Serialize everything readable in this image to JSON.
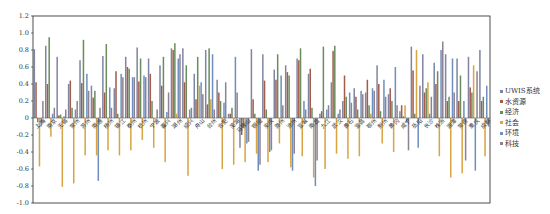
{
  "chart_data": {
    "type": "bar",
    "title": "",
    "xlabel": "",
    "ylabel": "",
    "ylim": [
      -1.0,
      1.2
    ],
    "yticks": [
      1.2,
      1.0,
      0.8,
      0.6,
      0.4,
      0.2,
      0,
      -0.2,
      -0.4,
      -0.6,
      -0.8,
      -1.0
    ],
    "ytick_labels": [
      "1.2",
      "1.0",
      "0.8",
      "0.6",
      "0.4",
      "0.2",
      "0",
      "-0.2",
      "-0.4",
      "-0.6",
      "-0.8",
      "-1.0"
    ],
    "grid": false,
    "legend_position": "right",
    "categories": [
      "上海",
      "南京",
      "无锡",
      "常州",
      "苏州",
      "南通",
      "扬州",
      "镇江",
      "泰州",
      "杭州",
      "宁波",
      "嘉兴",
      "湖州",
      "绍兴",
      "舟山",
      "台州",
      "合肥",
      "芜湖",
      "马鞍山",
      "铜陵",
      "安庆",
      "滁州",
      "池州",
      "宣城",
      "南昌",
      "九江",
      "武汉",
      "黄石",
      "宜昌",
      "鄂州",
      "荆州",
      "黄冈",
      "咸宁",
      "岳阳",
      "长沙",
      "株洲",
      "湘潭",
      "常德",
      "重庆",
      "成都"
    ],
    "series": [
      {
        "name": "UWIS系统",
        "color": "#7f86a3",
        "values": [
          0.81,
          0.85,
          0.72,
          0.4,
          0.68,
          0.38,
          0.73,
          0.35,
          0.72,
          0.83,
          0.7,
          0.62,
          0.82,
          0.82,
          0.52,
          0.8,
          0.45,
          0.05,
          -0.35,
          0.81,
          0.75,
          0.57,
          0.62,
          0.7,
          0.52,
          0.05,
          0.42,
          0.2,
          0.35,
          0.3,
          0.62,
          0.28,
          0.08,
          0.84,
          0.75,
          0.65,
          0.75,
          0.7,
          0.72,
          0.8
        ]
      },
      {
        "name": "水资源",
        "color": "#a25c4a",
        "values": [
          0.42,
          0.4,
          0.03,
          0.44,
          0.41,
          0.24,
          0.3,
          0.55,
          0.6,
          0.43,
          0.52,
          0.38,
          0.8,
          0.42,
          0.22,
          0.16,
          0.3,
          0.05,
          -0.2,
          0.22,
          0.44,
          0.45,
          0.54,
          0.68,
          0.58,
          0.08,
          0.79,
          0.5,
          0.25,
          0.45,
          0.4,
          0.35,
          0.15,
          0.56,
          0.3,
          0.4,
          0.2,
          0.2,
          0.36,
          0.2
        ]
      },
      {
        "name": "经济",
        "color": "#6b8c5e",
        "values": [
          -0.05,
          0.95,
          0.04,
          0.12,
          0.92,
          0.32,
          0.87,
          0.05,
          0.58,
          0.7,
          0.2,
          0.72,
          0.88,
          0.62,
          0.72,
          0.82,
          0.2,
          0.12,
          -0.1,
          0.05,
          0.1,
          0.75,
          0.5,
          0.82,
          0.12,
          0.84,
          0.85,
          0.25,
          0.1,
          0.15,
          0.08,
          0.2,
          0.02,
          0.05,
          0.35,
          0.55,
          0.25,
          0.5,
          0.3,
          0.25
        ]
      },
      {
        "name": "社会",
        "color": "#d8a444",
        "values": [
          -0.57,
          -0.22,
          -0.81,
          -0.77,
          -0.44,
          -0.44,
          -0.38,
          -0.44,
          -0.38,
          -0.26,
          -0.35,
          -0.52,
          0.05,
          -0.68,
          0.38,
          0.22,
          -0.6,
          -0.55,
          -0.52,
          -0.42,
          -0.52,
          -0.3,
          -0.58,
          -0.45,
          -0.7,
          -0.6,
          -0.42,
          -0.48,
          -0.45,
          0.05,
          -0.3,
          -0.4,
          0.15,
          0.8,
          0.42,
          -0.45,
          -0.7,
          -0.65,
          0.62,
          -0.45
        ]
      },
      {
        "name": "环境",
        "color": "#6e8fbf",
        "values": [
          -0.1,
          0.05,
          0.02,
          0.1,
          0.52,
          -0.74,
          0.36,
          0.52,
          0.48,
          0.5,
          0.0,
          0.07,
          0.7,
          0.1,
          0.42,
          0.75,
          0.18,
          0.72,
          -0.3,
          -0.62,
          -0.4,
          0.5,
          -0.62,
          0.2,
          -0.8,
          0.1,
          0.05,
          0.3,
          0.32,
          0.35,
          0.45,
          0.6,
          -0.05,
          -0.35,
          0.05,
          0.8,
          0.7,
          0.2,
          -0.62,
          0.38
        ]
      },
      {
        "name": "科技",
        "color": "#8e8292",
        "values": [
          0.2,
          0.12,
          0.1,
          0.2,
          0.32,
          0.12,
          0.12,
          0.48,
          0.48,
          0.48,
          0.1,
          0.3,
          0.75,
          0.12,
          0.28,
          0.1,
          0.42,
          0.3,
          -0.28,
          -0.55,
          -0.38,
          0.15,
          -0.42,
          0.1,
          -0.5,
          0.15,
          0.1,
          0.18,
          0.28,
          0.32,
          0.25,
          0.15,
          -0.38,
          0.38,
          0.25,
          0.9,
          0.3,
          -0.5,
          0.55,
          -0.1
        ]
      }
    ]
  },
  "legend": {
    "items": [
      {
        "label": "UWIS系统",
        "color": "#7f86a3"
      },
      {
        "label": "水资源",
        "color": "#a25c4a"
      },
      {
        "label": "经济",
        "color": "#6b8c5e"
      },
      {
        "label": "社会",
        "color": "#d8a444"
      },
      {
        "label": "环境",
        "color": "#6e8fbf"
      },
      {
        "label": "科技",
        "color": "#8e8292"
      }
    ]
  }
}
